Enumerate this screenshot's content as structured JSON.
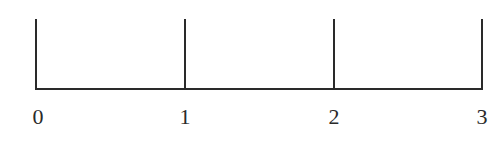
{
  "number_line": {
    "ticks": [
      {
        "label": "0",
        "x": 35
      },
      {
        "label": "1",
        "x": 184
      },
      {
        "label": "2",
        "x": 333
      },
      {
        "label": "3",
        "x": 482
      }
    ],
    "line_color": "#2a2a2a"
  }
}
